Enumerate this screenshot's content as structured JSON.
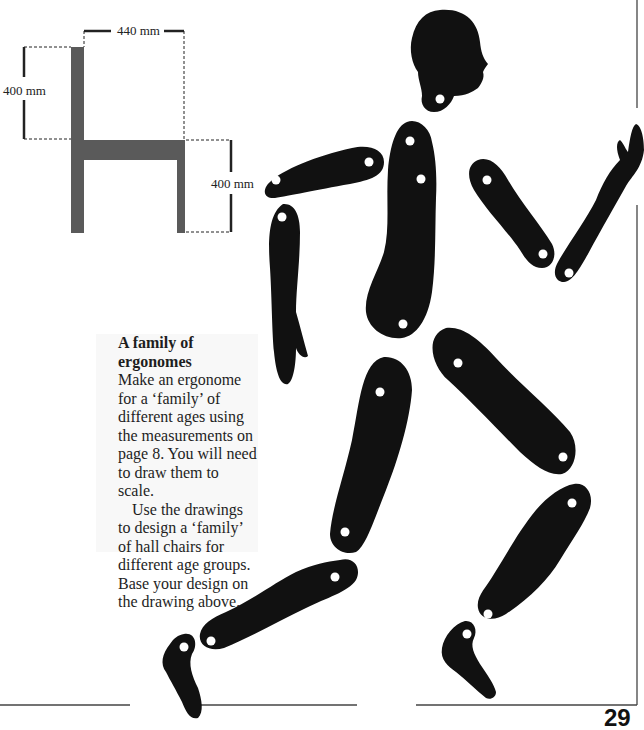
{
  "chair_diagram": {
    "top_width_label": "440 mm",
    "back_height_label": "400 mm",
    "seat_height_label": "400 mm",
    "chair_color": "#5a5a5a"
  },
  "activity_box": {
    "title": "A family of ergonomes",
    "paragraph_1": "Make an ergonome for a ‘family’ of different ages using the measurements on page 8. You will need to draw them to scale.",
    "paragraph_2": "Use the drawings to design a ‘family’ of hall chairs for different age groups. Base your design on the drawing above."
  },
  "figure": {
    "fill_color": "#111111",
    "parts": [
      "head",
      "torso",
      "upper-arm-left",
      "forearm-left",
      "upper-arm-right",
      "forearm-right",
      "thigh-left",
      "thigh-right",
      "shin-left",
      "shin-right",
      "foot-left",
      "foot-right"
    ]
  },
  "page": {
    "number": "29"
  }
}
